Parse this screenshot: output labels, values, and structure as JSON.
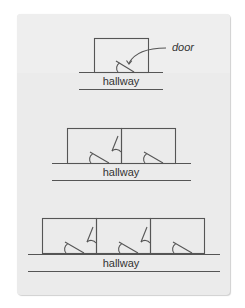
{
  "diagram": {
    "type": "floor-plan-sequence",
    "stroke_color": "#555555",
    "card_color": "#ebebeb",
    "callout": {
      "label": "door"
    },
    "panels": [
      {
        "id": "panel-1",
        "room_count": 1,
        "hallway_label": "hallway",
        "doors": 1
      },
      {
        "id": "panel-2",
        "room_count": 2,
        "hallway_label": "hallway",
        "doors": 3
      },
      {
        "id": "panel-3",
        "room_count": 3,
        "hallway_label": "hallway",
        "doors": 5
      }
    ]
  }
}
